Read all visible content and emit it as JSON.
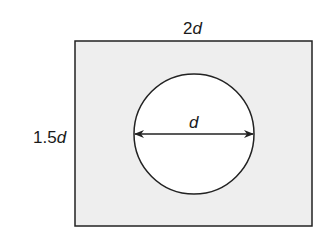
{
  "diagram": {
    "title": "",
    "shapes": {
      "rectangle": {
        "width_label_num": "2",
        "width_label_var": "d",
        "height_label_num": "1.5",
        "height_label_var": "d",
        "fill": "#eeeeee",
        "stroke": "#222222"
      },
      "circle": {
        "diameter_label": "d",
        "fill": "#ffffff",
        "stroke": "#222222"
      }
    }
  }
}
